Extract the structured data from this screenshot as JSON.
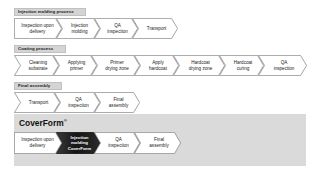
{
  "sections": [
    {
      "id": "injection-molding-process",
      "header": "Injection molding process",
      "steps": [
        {
          "label": "Inspection upon\ndelivery"
        },
        {
          "label": "Injection\nmolding"
        },
        {
          "label": "QA\ninspection"
        },
        {
          "label": "Transport"
        }
      ]
    },
    {
      "id": "coating-process",
      "header": "Coating process",
      "steps": [
        {
          "label": "Cleaning\nsubstrate"
        },
        {
          "label": "Applying\nprimer"
        },
        {
          "label": "Primer\ndrying zone"
        },
        {
          "label": "Apply\nhardcoat"
        },
        {
          "label": "Hardcoat\ndrying zone"
        },
        {
          "label": "Hardcoat\ncuring"
        },
        {
          "label": "QA\ninspection"
        }
      ]
    },
    {
      "id": "final-assembly",
      "header": "Final assembly",
      "steps": [
        {
          "label": "Transport"
        },
        {
          "label": "QA\ninspection"
        },
        {
          "label": "Final\nassembly"
        }
      ]
    }
  ],
  "coverform": {
    "title": "CoverForm",
    "trademark": "®",
    "steps": [
      {
        "label": "Inspection upon\ndelivery",
        "style": "light"
      },
      {
        "label": "Injection\nmolding\nCoverForm",
        "style": "dark"
      },
      {
        "label": "QA\ninspection",
        "style": "light"
      },
      {
        "label": "Final\nassembly",
        "style": "light"
      }
    ]
  },
  "colors": {
    "header_bar": "#d4d4d4",
    "panel_background": "#dadada",
    "chevron_fill": "#ffffff",
    "chevron_stroke": "#888888",
    "dark_chevron_fill": "#1c1c1c",
    "text": "#1a1a1a"
  }
}
